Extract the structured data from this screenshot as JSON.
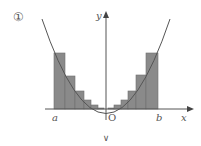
{
  "figure": {
    "choice_label": "①",
    "axis_labels": {
      "x": "x",
      "y": "y",
      "origin": "O"
    },
    "interval_labels": {
      "left": "a",
      "right": "b"
    },
    "footer_mark": "∨",
    "colors": {
      "bar_fill": "#8a8a8a",
      "bar_stroke": "#6f6f6f",
      "curve": "#555555",
      "axis": "#555555"
    }
  },
  "chart_data": {
    "type": "bar",
    "title": "",
    "curve": "y = x^2",
    "left_bars": [
      {
        "x0": 54,
        "x1": 65,
        "top": 53
      },
      {
        "x0": 65,
        "x1": 75,
        "top": 76
      },
      {
        "x0": 75,
        "x1": 84,
        "top": 91
      },
      {
        "x0": 84,
        "x1": 91,
        "top": 100
      },
      {
        "x0": 91,
        "x1": 98,
        "top": 105
      },
      {
        "x0": 98,
        "x1": 104,
        "top": 108
      }
    ],
    "right_bars": [
      {
        "x0": 108,
        "x1": 114,
        "top": 108
      },
      {
        "x0": 114,
        "x1": 121,
        "top": 105
      },
      {
        "x0": 121,
        "x1": 128,
        "top": 100
      },
      {
        "x0": 128,
        "x1": 136,
        "top": 91
      },
      {
        "x0": 136,
        "x1": 146,
        "top": 75
      },
      {
        "x0": 146,
        "x1": 158,
        "top": 53
      }
    ],
    "xlabel": "x",
    "ylabel": "y",
    "tick_labels": [
      "a",
      "O",
      "b"
    ],
    "grid": false
  }
}
